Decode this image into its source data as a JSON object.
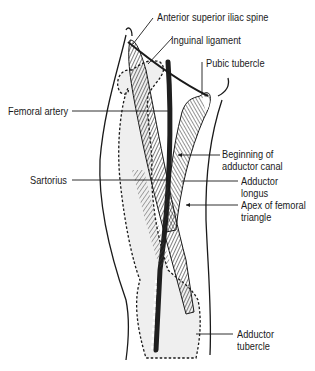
{
  "figure": {
    "colors": {
      "ink": "#1a1a1a",
      "muscle": "#3a3a3a",
      "shading": "#e6e6e6",
      "background": "#ffffff"
    }
  },
  "labels": {
    "anterior_superior_iliac_spine": "Anterior superior iliac spine",
    "inguinal_ligament": "Inguinal ligament",
    "pubic_tubercle": "Pubic tubercle",
    "femoral_artery": "Femoral artery",
    "beginning_adductor_canal_1": "Beginning of",
    "beginning_adductor_canal_2": "adductor canal",
    "sartorius": "Sartorius",
    "adductor_longus_1": "Adductor",
    "adductor_longus_2": "longus",
    "apex_femoral_triangle_1": "Apex of femoral",
    "apex_femoral_triangle_2": "triangle",
    "adductor_tubercle_1": "Adductor",
    "adductor_tubercle_2": "tubercle"
  }
}
